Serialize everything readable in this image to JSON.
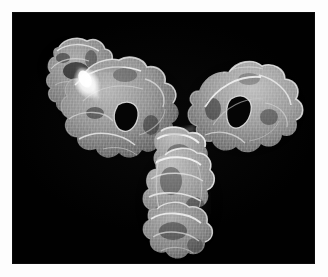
{
  "figure": {
    "kind": "molecular-surface-render",
    "shape": "Y-shaped",
    "render_style": "wireframe-mesh-surface",
    "colormap": "grayscale",
    "background_color": "#010101",
    "mat_color": "#fdfdfd",
    "accent_highlight_color": "#ffffff",
    "mesh_color": "#d8d8d8",
    "body_color": "#8a8a8a",
    "shadow_color": "#2a2a2a",
    "canvas": {
      "x": 13,
      "y": 13,
      "width": 301,
      "height": 250
    },
    "has_text_labels": false,
    "has_scale_bar": false,
    "has_axes": false,
    "has_legend": false
  },
  "regions": [
    {
      "name": "fab-arm-left-upper-tip",
      "label": "upper-left distal lobe",
      "center": [
        59,
        50
      ],
      "brightness": "medium"
    },
    {
      "name": "hinge-highlight-left",
      "label": "bright elbow highlight",
      "center": [
        75,
        70
      ],
      "brightness": "very-high"
    },
    {
      "name": "fab-arm-left-lobe",
      "label": "left Fab lobe with central cavity",
      "center": [
        108,
        100
      ],
      "brightness": "medium-high",
      "cavity": true
    },
    {
      "name": "fab-arm-right-lobe",
      "label": "right Fab lobe with central cavity",
      "center": [
        222,
        95
      ],
      "brightness": "medium-high",
      "cavity": true
    },
    {
      "name": "hinge-junction",
      "label": "central hinge junction",
      "center": [
        172,
        140
      ],
      "brightness": "high"
    },
    {
      "name": "fc-stem",
      "label": "Fc stem descending",
      "center": [
        176,
        190
      ],
      "brightness": "medium-high"
    },
    {
      "name": "fc-foot",
      "label": "Fc distal foot lobe",
      "center": [
        172,
        232
      ],
      "brightness": "medium"
    }
  ]
}
